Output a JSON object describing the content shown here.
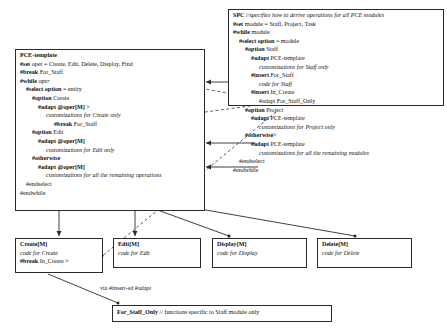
{
  "diagram": {
    "line_color": "#2a2a2a"
  },
  "spc_box": {
    "name": "SPC",
    "lines": [
      {
        "bold": "SPC",
        "italic": "//specifies how to derive operations for all PCE modules",
        "indent": 0
      },
      {
        "bold": "#set",
        "plain": " module = Staff, Project, Task",
        "indent": 0
      },
      {
        "bold": "#while",
        "plain": " module",
        "indent": 0
      },
      {
        "bold": "#select option",
        "plain": " = module",
        "indent": 1
      },
      {
        "bold": "#option",
        "plain": " Staff",
        "indent": 2
      },
      {
        "bold": "#adapt",
        "plain": " PCE-template",
        "indent": 3
      },
      {
        "italic": "customizations for Staff only",
        "indent": 4
      },
      {
        "bold": "#insert",
        "plain": " For_Staff",
        "indent": 3
      },
      {
        "italic": "code for Staff",
        "indent": 4
      },
      {
        "bold": "#insert",
        "plain": " In_Create",
        "indent": 3
      },
      {
        "plain": "#adapt For_Staff_Only",
        "indent": 4
      },
      {
        "bold": "#option",
        "plain": " Project",
        "indent": 2
      },
      {
        "bold": "#adapt",
        "plain": " PCE-template",
        "indent": 3
      },
      {
        "italic": "customizations for Project only",
        "indent": 4
      },
      {
        "bold": "#otherwise",
        "plain": ">",
        "indent": 2
      },
      {
        "bold": "#adapt",
        "plain": " PCE-template",
        "indent": 3
      },
      {
        "italic": "customizations for all the remaining modules",
        "indent": 4
      },
      {
        "plain": "#endselect",
        "indent": 1
      },
      {
        "plain": "#endwhile",
        "indent": 0
      }
    ]
  },
  "pce_box": {
    "name": "PCE-template",
    "lines": [
      {
        "title": "PCE-template",
        "indent": 0
      },
      {
        "bold": "#set",
        "plain": " oper = Create, Edit, Delete, Display, Find",
        "indent": 0
      },
      {
        "bold": "#break",
        "plain": " For_Staff",
        "indent": 0
      },
      {
        "bold": "#while",
        "italic": " oper",
        "indent": 0
      },
      {
        "bold": "#select option",
        "plain": " = entity",
        "indent": 1
      },
      {
        "bold": "#option",
        "plain": " Create",
        "indent": 2
      },
      {
        "bold": "#adapt @oper[M]",
        "plain": " >",
        "indent": 3
      },
      {
        "italic": "customizations for Create only",
        "indent": 4
      },
      {
        "bold": "#break",
        "plain": " For_Staff",
        "indent": 5
      },
      {
        "bold": "#option",
        "plain": " Edit",
        "indent": 2
      },
      {
        "bold": "#adapt @oper[M]",
        "indent": 3
      },
      {
        "italic": "customizations for Edit only",
        "indent": 4
      },
      {
        "bold": "#otherwise",
        "indent": 2
      },
      {
        "bold": "#adapt @oper[M]",
        "indent": 3
      },
      {
        "italic": "customizations for all the remaining operations",
        "indent": 4
      },
      {
        "plain": "#endselect",
        "indent": 1
      },
      {
        "plain": "#endwhile",
        "indent": 0
      }
    ]
  },
  "operation_boxes": [
    {
      "id": "create",
      "title": "Create[M]",
      "lines": [
        {
          "italic": "code for Create",
          "indent": 0
        },
        {
          "bold": "#break",
          "plain": " In_Create >",
          "indent": 0
        }
      ]
    },
    {
      "id": "edit",
      "title": "Edit[M]",
      "lines": [
        {
          "italic": "code for Edit",
          "indent": 0
        }
      ]
    },
    {
      "id": "display",
      "title": "Display[M]",
      "lines": [
        {
          "italic": "code for Display",
          "indent": 0
        }
      ]
    },
    {
      "id": "delete",
      "title": "Delete[M]",
      "lines": [
        {
          "italic": "code for Delete",
          "indent": 0
        }
      ]
    }
  ],
  "for_staff_only_box": {
    "title": "For_Staff_Only",
    "comment": "// functions specific to Staff module only"
  },
  "edge_labels": {
    "via_insert": "via #insert-ed #adapt"
  }
}
